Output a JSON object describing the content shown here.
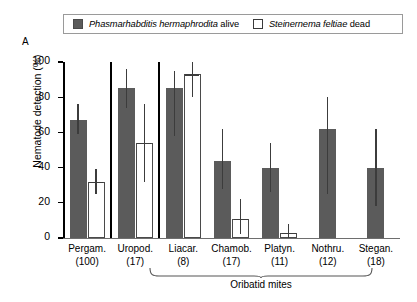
{
  "panel_label": "A",
  "legend": {
    "items": [
      {
        "swatch": "filled",
        "species": "Phasmarhabditis hermaphrodita",
        "state": " alive"
      },
      {
        "swatch": "open",
        "species": "Steinernema feltiae",
        "state": " dead"
      }
    ]
  },
  "colors": {
    "filled_bar": "#5b5b5b",
    "open_bar": "#ffffff",
    "open_bar_edge": "#4a4a4a",
    "error_bar": "#3c3c3c",
    "axis": "#000000"
  },
  "bracket": {
    "label": "Oribatid mites"
  },
  "chart_data": {
    "type": "bar",
    "title": "",
    "xlabel": "",
    "ylabel": "Nematode detection (%)",
    "ylim": [
      0,
      100
    ],
    "yticks": [
      0,
      20,
      40,
      60,
      80,
      100
    ],
    "ytick_labels": [
      "0",
      "20",
      "40",
      "60",
      "80",
      "100"
    ],
    "grid": false,
    "legend_position": "top",
    "categories": [
      "Pergam.",
      "Uropod.",
      "Liacar.",
      "Chamob.",
      "Platyn.",
      "Nothru.",
      "Stegan."
    ],
    "category_counts": [
      "(100)",
      "(17)",
      "(8)",
      "(17)",
      "(11)",
      "(12)",
      "(18)"
    ],
    "group_dividers_after": [
      "Pergam.",
      "Uropod."
    ],
    "series": [
      {
        "name": "Phasmarhabditis hermaphrodita alive",
        "style": "filled",
        "values": [
          67,
          85,
          85,
          44,
          40,
          62,
          40
        ],
        "err_low": [
          59,
          74,
          58,
          28,
          26,
          25,
          18
        ],
        "err_high": [
          76,
          96,
          95,
          62,
          54,
          80,
          62
        ]
      },
      {
        "name": "Steinernema feltiae dead",
        "style": "open",
        "values": [
          32,
          54,
          93,
          11,
          3,
          null,
          null
        ],
        "err_low": [
          25,
          32,
          80,
          2,
          0,
          null,
          null
        ],
        "err_high": [
          39,
          76,
          100,
          22,
          8,
          null,
          null
        ]
      }
    ]
  }
}
